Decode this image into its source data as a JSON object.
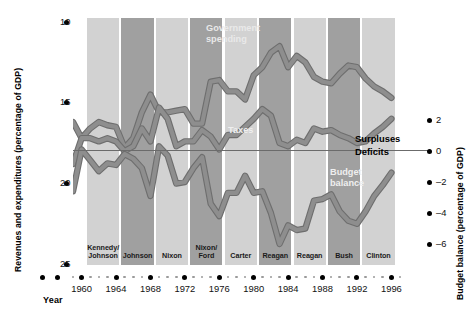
{
  "chart_data": {
    "type": "line",
    "title": "",
    "xlabel": "Year",
    "ylabel_left": "Revenues and expenditures (percentage of GDP)",
    "ylabel_right": "Budget balance (percentage of GDP)",
    "x": [
      1959,
      1960,
      1961,
      1962,
      1963,
      1964,
      1965,
      1966,
      1967,
      1968,
      1969,
      1970,
      1971,
      1972,
      1973,
      1974,
      1975,
      1976,
      1977,
      1978,
      1979,
      1980,
      1981,
      1982,
      1983,
      1984,
      1985,
      1986,
      1987,
      1988,
      1989,
      1990,
      1991,
      1992,
      1993,
      1994,
      1995,
      1996
    ],
    "xlim": [
      1959,
      1997
    ],
    "ylim_left": [
      9.0,
      25.8
    ],
    "ylim_right": [
      -7.4,
      3.0
    ],
    "yticks_left": [
      10,
      15,
      20,
      25
    ],
    "yticks_right": [
      2,
      0,
      -2,
      -4,
      -6
    ],
    "xticks_major": [
      1960,
      1964,
      1968,
      1972,
      1976,
      1980,
      1984,
      1988,
      1992,
      1996
    ],
    "grid": false,
    "legend": "inline annotations",
    "series": [
      {
        "name": "Government spending",
        "color": "#8e8e8e",
        "values": [
          18.8,
          17.8,
          18.4,
          18.8,
          18.6,
          18.5,
          17.2,
          17.8,
          19.4,
          20.5,
          19.4,
          19.4,
          19.5,
          19.6,
          18.7,
          18.7,
          21.3,
          21.4,
          20.7,
          20.7,
          20.2,
          21.7,
          22.2,
          23.1,
          23.5,
          22.2,
          22.9,
          22.5,
          21.6,
          21.3,
          21.2,
          21.8,
          22.3,
          22.2,
          21.5,
          21.0,
          20.7,
          20.3
        ]
      },
      {
        "name": "Taxes",
        "color": "#8e8e8e",
        "values": [
          16.2,
          17.8,
          17.8,
          17.6,
          17.8,
          17.6,
          17.0,
          17.3,
          18.4,
          17.6,
          19.7,
          19.0,
          17.3,
          17.6,
          17.6,
          18.3,
          17.9,
          17.1,
          18.0,
          18.0,
          18.5,
          19.0,
          19.6,
          19.2,
          17.5,
          17.3,
          17.7,
          17.5,
          18.4,
          18.2,
          18.3,
          18.0,
          17.8,
          17.5,
          17.6,
          18.1,
          18.5,
          19.0
        ]
      },
      {
        "name": "Budget balance",
        "color": "#8e8e8e",
        "axis": "right",
        "values": [
          -2.6,
          0.1,
          -0.6,
          -1.3,
          -0.8,
          -0.9,
          -0.2,
          -0.5,
          -1.1,
          -2.9,
          0.3,
          -0.3,
          -2.1,
          -2.0,
          -1.1,
          -0.4,
          -3.4,
          -4.2,
          -2.7,
          -2.7,
          -1.6,
          -2.7,
          -2.6,
          -4.0,
          -6.0,
          -4.8,
          -5.1,
          -5.0,
          -3.2,
          -3.1,
          -2.8,
          -3.9,
          -4.5,
          -4.7,
          -3.9,
          -2.9,
          -2.2,
          -1.4
        ]
      }
    ],
    "presidential_bands": [
      {
        "label": "Kennedy/\nJohnson",
        "start": 1961,
        "end": 1964,
        "shade": "light"
      },
      {
        "label": "Johnson",
        "start": 1965,
        "end": 1968,
        "shade": "dark"
      },
      {
        "label": "Nixon",
        "start": 1969,
        "end": 1972,
        "shade": "light"
      },
      {
        "label": "Nixon/\nFord",
        "start": 1973,
        "end": 1976,
        "shade": "dark"
      },
      {
        "label": "Carter",
        "start": 1977,
        "end": 1980,
        "shade": "light"
      },
      {
        "label": "Reagan",
        "start": 1981,
        "end": 1984,
        "shade": "dark"
      },
      {
        "label": "Reagan",
        "start": 1985,
        "end": 1988,
        "shade": "light"
      },
      {
        "label": "Bush",
        "start": 1989,
        "end": 1992,
        "shade": "dark"
      },
      {
        "label": "Clinton",
        "start": 1993,
        "end": 1996,
        "shade": "light"
      }
    ],
    "annotations": [
      {
        "name": "government-spending",
        "text": "Government\nspending"
      },
      {
        "name": "taxes",
        "text": "Taxes"
      },
      {
        "name": "budget-balance",
        "text": "Budget\nbalance"
      },
      {
        "name": "surpluses",
        "text": "Surpluses"
      },
      {
        "name": "deficits",
        "text": "Deficits"
      }
    ]
  },
  "axes": {
    "left_title": "Revenues and expenditures (percentage of GDP)",
    "right_title": "Budget balance (percentage of GDP)",
    "x_title": "Year",
    "left_ticks": [
      "25",
      "20",
      "15",
      "10"
    ],
    "right_ticks": [
      "2",
      "0",
      "–2",
      "–4",
      "–6"
    ],
    "x_ticks": [
      "1960",
      "1964",
      "1968",
      "1972",
      "1976",
      "1980",
      "1984",
      "1988",
      "1992",
      "1996"
    ]
  },
  "bands": [
    {
      "label_line1": "Kennedy/",
      "label_line2": "Johnson"
    },
    {
      "label_line1": "Johnson",
      "label_line2": ""
    },
    {
      "label_line1": "Nixon",
      "label_line2": ""
    },
    {
      "label_line1": "Nixon/",
      "label_line2": "Ford"
    },
    {
      "label_line1": "Carter",
      "label_line2": ""
    },
    {
      "label_line1": "Reagan",
      "label_line2": ""
    },
    {
      "label_line1": "Reagan",
      "label_line2": ""
    },
    {
      "label_line1": "Bush",
      "label_line2": ""
    },
    {
      "label_line1": "Clinton",
      "label_line2": ""
    }
  ],
  "annotations": {
    "gov_line1": "Government",
    "gov_line2": "spending",
    "taxes": "Taxes",
    "budget_line1": "Budget",
    "budget_line2": "balance",
    "surpluses": "Surpluses",
    "deficits": "Deficits"
  },
  "colors": {
    "band_light": "#d2d2d2",
    "band_dark": "#a0a0a0",
    "line": "#8e8e8e",
    "line_edge": "#6e6e6e",
    "text": "#000000",
    "zero_line": "#6b6b6b"
  }
}
